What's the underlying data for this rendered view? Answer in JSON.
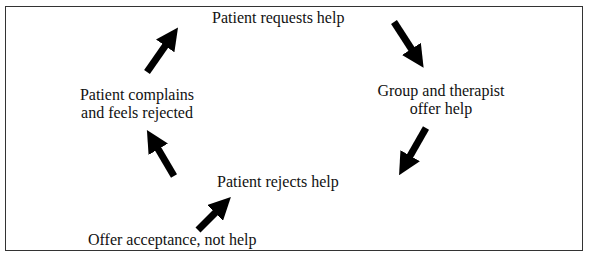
{
  "diagram": {
    "type": "cycle",
    "nodes": {
      "top": "Patient requests help",
      "right_line1": "Group and therapist",
      "right_line2": "offer help",
      "bottom": "Patient rejects help",
      "left_line1": "Patient complains",
      "left_line2": "and feels rejected",
      "intervention": "Offer acceptance, not help"
    },
    "edges": [
      {
        "from": "Patient complains and feels rejected",
        "to": "Patient requests help"
      },
      {
        "from": "Patient requests help",
        "to": "Group and therapist offer help"
      },
      {
        "from": "Group and therapist offer help",
        "to": "Patient rejects help"
      },
      {
        "from": "Patient rejects help",
        "to": "Patient complains and feels rejected"
      },
      {
        "from": "Offer acceptance, not help",
        "to": "Patient rejects help"
      }
    ],
    "colors": {
      "border": "#333333",
      "arrow": "#000000",
      "text": "#111111"
    }
  }
}
